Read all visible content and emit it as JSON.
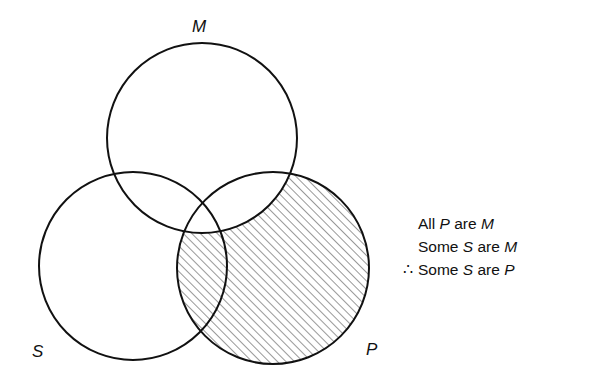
{
  "diagram": {
    "type": "venn",
    "circles": [
      {
        "id": "M",
        "label": "M",
        "cx": 202,
        "cy": 138,
        "r": 95
      },
      {
        "id": "S",
        "label": "S",
        "cx": 133,
        "cy": 266,
        "r": 94
      },
      {
        "id": "P",
        "label": "P",
        "cx": 273,
        "cy": 268,
        "r": 96
      }
    ],
    "shaded_region": "P outside M (hatched)"
  },
  "labels": {
    "M": "M",
    "S": "S",
    "P": "P"
  },
  "syllogism": {
    "premise1": {
      "a": "All ",
      "t1": "P",
      "b": " are ",
      "t2": "M"
    },
    "premise2": {
      "a": "Some ",
      "t1": "S",
      "b": " are ",
      "t2": "M"
    },
    "conclusion": {
      "symbol": "∴",
      "a": "Some ",
      "t1": "S",
      "b": " are ",
      "t2": "P"
    }
  }
}
